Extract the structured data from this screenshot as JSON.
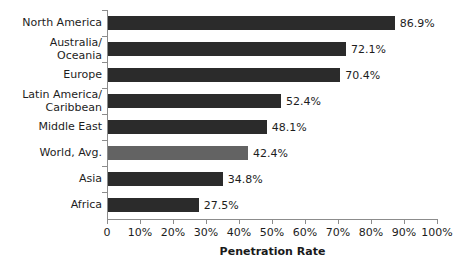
{
  "chart_data": {
    "type": "bar",
    "orientation": "horizontal",
    "title": "",
    "subtitle": "",
    "xlabel": "Penetration Rate",
    "ylabel": "",
    "xlim": [
      0,
      100
    ],
    "grid": false,
    "legend": null,
    "categories": [
      "North America",
      "Australia/\nOceania",
      "Europe",
      "Latin America/\nCaribbean",
      "Middle East",
      "World, Avg.",
      "Asia",
      "Africa"
    ],
    "values": [
      86.9,
      72.1,
      70.4,
      52.4,
      48.1,
      42.4,
      34.8,
      27.5
    ],
    "value_labels": [
      "86.9%",
      "72.1%",
      "70.4%",
      "52.4%",
      "48.1%",
      "42.4%",
      "34.8%",
      "27.5%"
    ],
    "highlight_index": 5,
    "bar_color": "#2b2b2b",
    "highlight_color": "#636363",
    "axis_color": "#8c8c8c",
    "text_color": "#1d1d1d",
    "x_ticks": [
      0,
      10,
      20,
      30,
      40,
      50,
      60,
      70,
      80,
      90,
      100
    ],
    "x_tick_labels": [
      "0",
      "10%",
      "20%",
      "30%",
      "40%",
      "50%",
      "60%",
      "70%",
      "80%",
      "90%",
      "100%"
    ]
  }
}
